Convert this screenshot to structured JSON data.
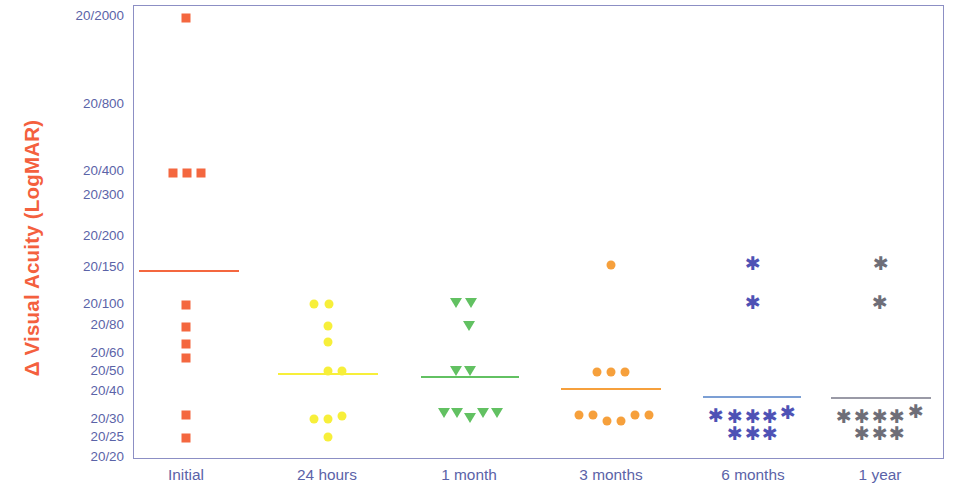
{
  "chart_data": {
    "type": "scatter",
    "title": "",
    "xlabel": "",
    "ylabel": "Δ Visual Acuity (LogMAR)",
    "grid": false,
    "legend": "none",
    "categories": [
      "Initial",
      "24 hours",
      "1 month",
      "3 months",
      "6 months",
      "1 year"
    ],
    "y_tick_labels": [
      "20/2000",
      "20/800",
      "20/400",
      "20/300",
      "20/200",
      "20/150",
      "20/100",
      "20/80",
      "20/60",
      "20/50",
      "20/40",
      "20/30",
      "20/25",
      "20/20"
    ],
    "y_tick_logmar": [
      2.0,
      1.6,
      1.3,
      1.18,
      1.0,
      0.875,
      0.7,
      0.6,
      0.48,
      0.4,
      0.3,
      0.18,
      0.1,
      0.0
    ],
    "ylim_labels": [
      "20/2000",
      "20/20"
    ],
    "series": [
      {
        "name": "Initial",
        "marker": "square",
        "color": "#F4673F",
        "mean_line_label": "20/150",
        "points": [
          {
            "acuity": "20/2000"
          },
          {
            "acuity": "20/400"
          },
          {
            "acuity": "20/400"
          },
          {
            "acuity": "20/400"
          },
          {
            "acuity": "20/100"
          },
          {
            "acuity": "20/80"
          },
          {
            "acuity": "20/70"
          },
          {
            "acuity": "20/60"
          },
          {
            "acuity": "20/30"
          },
          {
            "acuity": "20/25"
          }
        ]
      },
      {
        "name": "24 hours",
        "marker": "circle",
        "color": "#F7EF3A",
        "mean_line_label": "20/50",
        "points": [
          {
            "acuity": "20/100"
          },
          {
            "acuity": "20/100"
          },
          {
            "acuity": "20/80"
          },
          {
            "acuity": "20/70"
          },
          {
            "acuity": "20/50"
          },
          {
            "acuity": "20/50"
          },
          {
            "acuity": "20/30"
          },
          {
            "acuity": "20/30"
          },
          {
            "acuity": "20/30"
          },
          {
            "acuity": "20/25"
          }
        ]
      },
      {
        "name": "1 month",
        "marker": "triangle-down",
        "color": "#62C162",
        "mean_line_label": "20/50",
        "points": [
          {
            "acuity": "20/100"
          },
          {
            "acuity": "20/100"
          },
          {
            "acuity": "20/80"
          },
          {
            "acuity": "20/50"
          },
          {
            "acuity": "20/50"
          },
          {
            "acuity": "20/30"
          },
          {
            "acuity": "20/30"
          },
          {
            "acuity": "20/30"
          },
          {
            "acuity": "20/30"
          },
          {
            "acuity": "20/30"
          }
        ]
      },
      {
        "name": "3 months",
        "marker": "circle",
        "color": "#F6A03C",
        "mean_line_label": "20/40",
        "points": [
          {
            "acuity": "20/150"
          },
          {
            "acuity": "20/50"
          },
          {
            "acuity": "20/50"
          },
          {
            "acuity": "20/50"
          },
          {
            "acuity": "20/30"
          },
          {
            "acuity": "20/30"
          },
          {
            "acuity": "20/30"
          },
          {
            "acuity": "20/30"
          },
          {
            "acuity": "20/30"
          },
          {
            "acuity": "20/30"
          }
        ]
      },
      {
        "name": "6 months",
        "marker": "asterisk",
        "color": "#4E52B5",
        "mean_line_label": "20/40",
        "points": [
          {
            "acuity": "20/150"
          },
          {
            "acuity": "20/100"
          },
          {
            "acuity": "20/30"
          },
          {
            "acuity": "20/30"
          },
          {
            "acuity": "20/30"
          },
          {
            "acuity": "20/30"
          },
          {
            "acuity": "20/30"
          },
          {
            "acuity": "20/25"
          },
          {
            "acuity": "20/25"
          },
          {
            "acuity": "20/25"
          }
        ]
      },
      {
        "name": "1 year",
        "marker": "asterisk",
        "color": "#6E6E78",
        "mean_line_label": "20/40",
        "points": [
          {
            "acuity": "20/150"
          },
          {
            "acuity": "20/100"
          },
          {
            "acuity": "20/30"
          },
          {
            "acuity": "20/30"
          },
          {
            "acuity": "20/30"
          },
          {
            "acuity": "20/30"
          },
          {
            "acuity": "20/30"
          },
          {
            "acuity": "20/25"
          },
          {
            "acuity": "20/25"
          },
          {
            "acuity": "20/25"
          }
        ]
      }
    ],
    "colors": {
      "axis": "#8C8FC4",
      "tick_text": "#5B63A8",
      "ylabel_text": "#F4603E"
    }
  },
  "layout": {
    "plot": {
      "left": 133,
      "top": 5,
      "width": 811,
      "height": 454
    },
    "y_ticks_px": [
      17,
      105,
      172,
      196,
      237,
      268,
      305,
      326,
      354,
      372,
      392,
      420,
      438,
      458
    ],
    "x_ticks_px": [
      186,
      327,
      469,
      611,
      753,
      880
    ],
    "series_px": [
      {
        "name": "Initial",
        "marker": "square",
        "color": "#F4673F",
        "size": 9,
        "mean_line": {
          "x1": 138,
          "x2": 238,
          "y": 269,
          "color": "#F4673F"
        },
        "pts": [
          [
            185,
            17
          ],
          [
            172,
            172
          ],
          [
            186,
            172
          ],
          [
            200,
            172
          ],
          [
            185,
            304
          ],
          [
            185,
            326
          ],
          [
            185,
            343
          ],
          [
            185,
            357
          ],
          [
            185,
            414
          ],
          [
            185,
            437
          ]
        ]
      },
      {
        "name": "24 hours",
        "marker": "circle",
        "color": "#F7EF3A",
        "size": 9,
        "mean_line": {
          "x1": 277,
          "x2": 377,
          "y": 372,
          "color": "#F7EF3A"
        },
        "pts": [
          [
            313,
            303
          ],
          [
            328,
            303
          ],
          [
            327,
            325
          ],
          [
            327,
            341
          ],
          [
            327,
            370
          ],
          [
            341,
            370
          ],
          [
            313,
            418
          ],
          [
            327,
            418
          ],
          [
            341,
            415
          ],
          [
            327,
            436
          ]
        ]
      },
      {
        "name": "1 month",
        "marker": "triangle-down",
        "color": "#62C162",
        "size": 11,
        "mean_line": {
          "x1": 420,
          "x2": 518,
          "y": 375,
          "color": "#62C162"
        },
        "pts": [
          [
            455,
            302
          ],
          [
            470,
            302
          ],
          [
            468,
            325
          ],
          [
            455,
            370
          ],
          [
            469,
            370
          ],
          [
            443,
            412
          ],
          [
            456,
            412
          ],
          [
            469,
            417
          ],
          [
            482,
            412
          ],
          [
            496,
            412
          ]
        ]
      },
      {
        "name": "3 months",
        "marker": "circle",
        "color": "#F6A03C",
        "size": 9,
        "mean_line": {
          "x1": 560,
          "x2": 660,
          "y": 387,
          "color": "#F6A03C"
        },
        "pts": [
          [
            610,
            264
          ],
          [
            596,
            371
          ],
          [
            610,
            371
          ],
          [
            624,
            371
          ],
          [
            578,
            414
          ],
          [
            592,
            414
          ],
          [
            606,
            420
          ],
          [
            620,
            420
          ],
          [
            634,
            414
          ],
          [
            648,
            414
          ]
        ]
      },
      {
        "name": "6 months",
        "marker": "asterisk",
        "color": "#4E52B5",
        "size": 19,
        "mean_line": {
          "x1": 702,
          "x2": 800,
          "y": 395,
          "color": "#7C9FD4"
        },
        "pts": [
          [
            752,
            264
          ],
          [
            752,
            303
          ],
          [
            715,
            416
          ],
          [
            734,
            417
          ],
          [
            752,
            417
          ],
          [
            769,
            417
          ],
          [
            787,
            413
          ],
          [
            734,
            434
          ],
          [
            752,
            434
          ],
          [
            769,
            434
          ]
        ]
      },
      {
        "name": "1 year",
        "marker": "asterisk",
        "color": "#6E6E78",
        "size": 19,
        "mean_line": {
          "x1": 830,
          "x2": 930,
          "y": 396,
          "color": "#9A9AA6"
        },
        "pts": [
          [
            880,
            264
          ],
          [
            879,
            303
          ],
          [
            843,
            417
          ],
          [
            861,
            417
          ],
          [
            879,
            417
          ],
          [
            896,
            417
          ],
          [
            915,
            412
          ],
          [
            861,
            434
          ],
          [
            879,
            434
          ],
          [
            896,
            434
          ]
        ]
      }
    ],
    "x_label_y": 466
  }
}
